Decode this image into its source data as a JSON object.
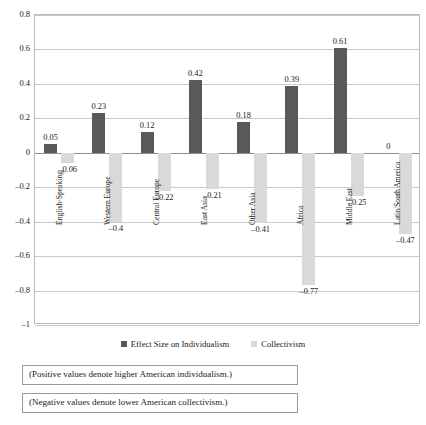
{
  "chart_data": {
    "type": "bar",
    "title": "",
    "xlabel": "",
    "ylabel": "",
    "ylim": [
      -1,
      0.8
    ],
    "ytick_step": 0.2,
    "grid": true,
    "legend_position": "bottom",
    "categories": [
      "English-Speaking",
      "Western Europe",
      "Central Europe",
      "East Asia",
      "Other Asia",
      "Africa",
      "Middle East",
      "Latin/South America"
    ],
    "yticks": [
      "0.8",
      "0.6",
      "0.4",
      "0.2",
      "0",
      "-0.2",
      "-0.4",
      "-0.6",
      "-0.8",
      "-1"
    ],
    "series": [
      {
        "name": "Effect Size on Individualism",
        "color": "#595959",
        "values": [
          0.05,
          0.23,
          0.12,
          0.42,
          0.18,
          0.39,
          0.61,
          0
        ],
        "labels": [
          "0.05",
          "0.23",
          "0.12",
          "0.42",
          "0.18",
          "0.39",
          "0.61",
          "0"
        ]
      },
      {
        "name": "Collectivism",
        "color": "#d9d9d9",
        "values": [
          -0.06,
          -0.4,
          -0.22,
          -0.21,
          -0.41,
          -0.77,
          -0.25,
          -0.47
        ],
        "labels": [
          "–0.06",
          "–0.4",
          "–0.22",
          "–0.21",
          "–0.41",
          "–0.77",
          "–0.25",
          "–0.47"
        ]
      }
    ]
  },
  "legend": {
    "items": [
      {
        "label": "Effect Size on Individualism"
      },
      {
        "label": "Collectivism"
      }
    ]
  },
  "captions": {
    "positive": "(Positive values denote higher American individualism.)",
    "negative": "(Negative values denote lower American collectivism.)"
  }
}
